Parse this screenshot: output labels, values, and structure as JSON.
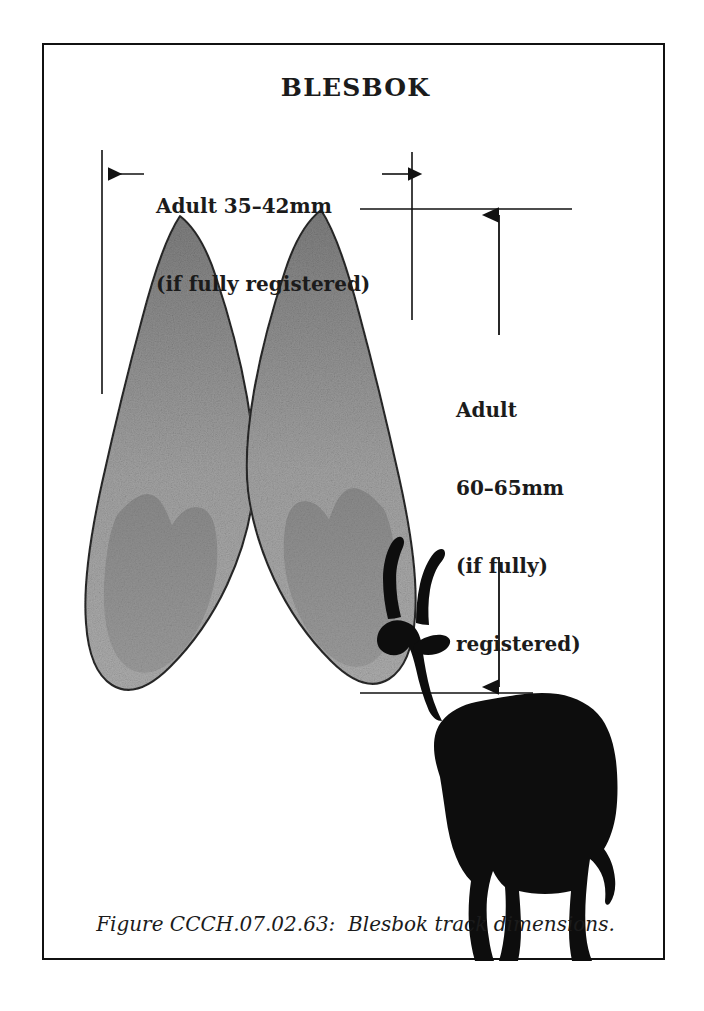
{
  "figure": {
    "title": "BLESBOK",
    "caption": "Figure CCCH.07.02.63:  Blesbok track dimensions.",
    "caption_number": "CCCH.07.02.63",
    "subject": "Blesbok",
    "plate_border_color": "#111111",
    "background_color": "#ffffff",
    "ink_color": "#1b1b1b"
  },
  "dimensions": {
    "width": {
      "line1": "Adult 35–42mm",
      "line2": "(if fully registered)",
      "measure": "35–42mm",
      "min_mm": 35,
      "max_mm": 42,
      "axis": "width",
      "qualifier": "if fully registered"
    },
    "height": {
      "line1": "Adult",
      "line2": "60–65mm",
      "line3": "(if fully)",
      "line4": "registered)",
      "measure": "60–65mm",
      "min_mm": 60,
      "max_mm": 65,
      "axis": "length",
      "qualifier": "if fully registered"
    }
  },
  "artwork": {
    "track_fill_light": "#a9a9a9",
    "track_fill_dark": "#8a8a8a",
    "track_pad_fill": "#8f8f8f",
    "track_outline": "#2a2a2a",
    "silhouette_fill": "#0d0d0d",
    "hooves": [
      {
        "name": "left-hoof-print"
      },
      {
        "name": "right-hoof-print"
      }
    ],
    "animal": "blesbok-silhouette"
  }
}
